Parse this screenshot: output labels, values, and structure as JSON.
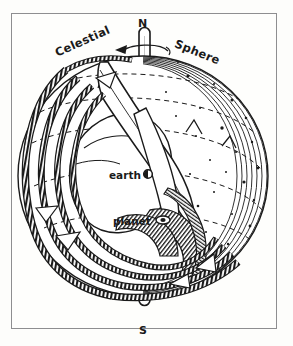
{
  "figure": {
    "kind": "hand-drawn-ink-illustration",
    "background_color": "#fdfdfb",
    "ink_color": "#1a1a1a",
    "frame_color": "#8e8e90"
  },
  "labels": {
    "north_pole": "N",
    "south_pole": "S",
    "celestial": "Celestial",
    "sphere": "Sphere",
    "earth": "earth",
    "planet": "planet"
  },
  "markers": {
    "earth_marker": "filled-circle",
    "planet_marker": "ringed-ellipse",
    "rotation_arrow": "counterclockwise-arrow-about-polar-axis",
    "axis": "polar-axis-rod"
  },
  "geometry": {
    "sphere_center_x": 143,
    "sphere_center_y": 176,
    "sphere_radius_x": 125,
    "sphere_radius_y": 120,
    "ring_count": 4,
    "dashed_latitude_arcs": 5
  }
}
